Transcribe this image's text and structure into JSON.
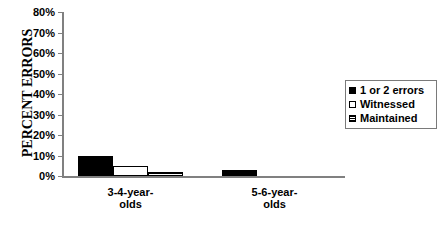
{
  "chart_data": {
    "type": "bar",
    "title": "",
    "subtitle": "",
    "xlabel": "",
    "ylabel": "PERCENT ERRORS",
    "categories": [
      "3-4-year-olds",
      "5-6-year-olds"
    ],
    "series": [
      {
        "name": "1 or 2 errors",
        "values": [
          10,
          3
        ],
        "swatch": "solid-black"
      },
      {
        "name": "Witnessed",
        "values": [
          5,
          0
        ],
        "swatch": "open-white"
      },
      {
        "name": "Maintained",
        "values": [
          2,
          0
        ],
        "swatch": "horizontal-hatch"
      }
    ],
    "ylim": [
      0,
      80
    ],
    "ytick_step": 10,
    "ytick_labels": [
      "0%",
      "10%",
      "20%",
      "30%",
      "40%",
      "50%",
      "60%",
      "70%",
      "80%"
    ],
    "ytick_values": [
      0,
      10,
      20,
      30,
      40,
      50,
      60,
      70,
      80
    ],
    "grid": false,
    "legend_position": "right"
  },
  "axis": {
    "y_title": "PERCENT ERRORS",
    "ticks": [
      {
        "label": "80%",
        "value": 80
      },
      {
        "label": "70%",
        "value": 70
      },
      {
        "label": "60%",
        "value": 60
      },
      {
        "label": "50%",
        "value": 50
      },
      {
        "label": "40%",
        "value": 40
      },
      {
        "label": "30%",
        "value": 30
      },
      {
        "label": "20%",
        "value": 20
      },
      {
        "label": "10%",
        "value": 10
      },
      {
        "label": "0%",
        "value": 0
      }
    ]
  },
  "categories": [
    {
      "line1": "3-4-year-",
      "line2": "olds"
    },
    {
      "line1": "5-6-year-",
      "line2": "olds"
    }
  ],
  "legend": {
    "items": [
      {
        "label": "1 or 2 errors"
      },
      {
        "label": "Witnessed"
      },
      {
        "label": "Maintained"
      }
    ]
  },
  "colors": {
    "series_0": "#000000",
    "series_1": "#ffffff",
    "series_2": "#000000",
    "axis": "#808080",
    "text": "#000000",
    "background": "#ffffff"
  }
}
